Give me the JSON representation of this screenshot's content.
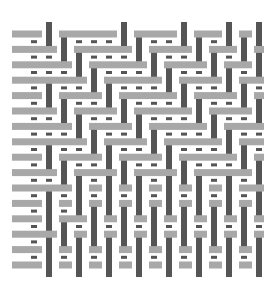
{
  "diagram": {
    "title": "",
    "type": "weave-interlacement",
    "colors": {
      "warp": "#555555",
      "weft": "#a8a8a8",
      "background": "#ffffff"
    },
    "grid": {
      "x0": 34,
      "y0": 34,
      "pitch_x": 15,
      "pitch_y": 15.4,
      "cols": 16,
      "rows": 16
    },
    "pattern": [
      "FWFFFFWFFFWFFWFW",
      "FFWFFFFWFFFWFFWF",
      "FFFWFFFFWFFFWFFW",
      "FFFFWFFFFWFFFWFF",
      "FWFFFWFFFFWFFFWF",
      "FFWFFFWFFFFWFFFW",
      "FFFWFFFWFFFFWFFF",
      "FFFFWFFFWFFFFWFF",
      "FWFFFWFFFWFFFFWF",
      "FFWFFFWFFFWFFFFW",
      "FFFWFWFWFWFWFWFF",
      "FWFWFWFWFWFWFWFW",
      "FWFFWFWFWFWFWFWF",
      "FFWFWFWFWFWFWFWF",
      "FWFWFWFWFWFWFWFW",
      "FWFWFWFWFWFWFWFW"
    ]
  }
}
